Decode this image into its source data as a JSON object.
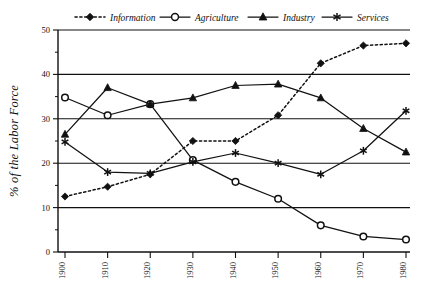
{
  "chart_data": {
    "type": "line",
    "title": "",
    "subtitle": "",
    "xlabel": "",
    "ylabel": "% of the Labor Force",
    "x": [
      1900,
      1910,
      1920,
      1930,
      1940,
      1950,
      1960,
      1970,
      1980
    ],
    "xticklabels": [
      "1900",
      "1910",
      "1920",
      "1930",
      "1940",
      "1950",
      "1960",
      "1970",
      "1980"
    ],
    "yticklabels": [
      "0",
      "10",
      "20",
      "30",
      "40",
      "50"
    ],
    "yticks": [
      0,
      10,
      20,
      30,
      40,
      50
    ],
    "yminorticks": [
      5,
      15,
      25,
      35,
      45
    ],
    "xlim": [
      1900,
      1980
    ],
    "ylim": [
      0,
      50
    ],
    "grid": "horizontal",
    "legend_position": "top",
    "series": [
      {
        "name": "Information",
        "marker": "diamond-filled",
        "linestyle": "dotted",
        "color": "#111111",
        "values": [
          12.5,
          14.7,
          17.5,
          25.0,
          25.0,
          30.8,
          42.5,
          46.5,
          47.0
        ]
      },
      {
        "name": "Agriculture",
        "marker": "circle-open",
        "linestyle": "solid",
        "color": "#111111",
        "values": [
          34.8,
          30.8,
          33.3,
          20.7,
          15.8,
          12.0,
          6.0,
          3.5,
          2.8
        ]
      },
      {
        "name": "Industry",
        "marker": "triangle-filled",
        "linestyle": "solid",
        "color": "#111111",
        "values": [
          26.5,
          37.0,
          33.3,
          34.7,
          37.5,
          37.8,
          34.7,
          27.8,
          22.5
        ]
      },
      {
        "name": "Services",
        "marker": "star",
        "linestyle": "solid",
        "color": "#111111",
        "values": [
          24.8,
          18.0,
          17.7,
          20.3,
          22.3,
          20.0,
          17.5,
          22.8,
          31.8
        ]
      }
    ]
  },
  "legend": {
    "items": [
      {
        "label": "Information"
      },
      {
        "label": "Agriculture"
      },
      {
        "label": "Industry"
      },
      {
        "label": "Services"
      }
    ]
  },
  "colors": {
    "ink": "#111111",
    "background": "#ffffff"
  }
}
